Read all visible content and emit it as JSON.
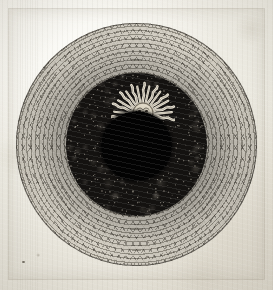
{
  "artwork": {
    "title": "Total Solar Eclipse",
    "medium": "Copperplate engraving on laid paper",
    "subject_description": "A total solar eclipse rendered as concentric rings: a solid black lunar disc at centre, a dark granular inner corona, a broad zig-zag hatched outer corona, and a decorative radiant sun-face emblem emerging at the upper edge of the lunar disc.",
    "paper_color": "#efece5",
    "ink_color": "#2e2a23"
  },
  "figure": {
    "outer_corona": {
      "label": "Outer corona",
      "texture": "concentric zig-zag burin hatching",
      "tone": "#cfcabd"
    },
    "inner_corona": {
      "label": "Inner corona",
      "texture": "dense granular stipple",
      "tone": "#141210"
    },
    "lunar_disc": {
      "label": "Lunar disc",
      "texture": "solid black",
      "tone": "#030303"
    }
  },
  "emblem": {
    "name": "radiant-sun-face",
    "label": "Sun with human face",
    "ray_count_wavy": 8,
    "ray_count_straight": 8,
    "face_features": [
      "eyes",
      "brow",
      "nose",
      "mouth"
    ],
    "tone": "#e8e2d2"
  },
  "marks": {
    "plate_mark": "faint rectangular plate impression",
    "foxing_speck": "small ink speck lower-left"
  }
}
